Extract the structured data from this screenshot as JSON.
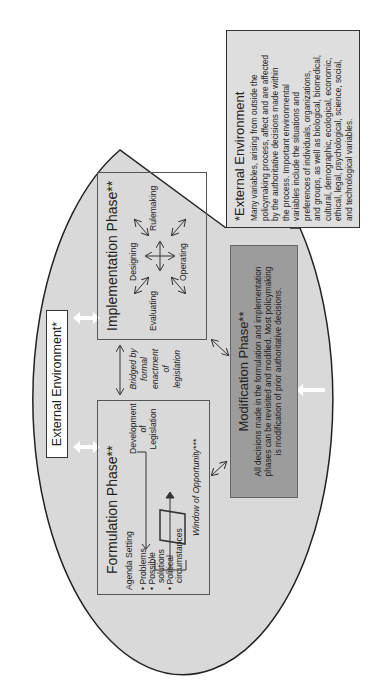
{
  "external_environment_label": "External Environment*",
  "formulation": {
    "title": "Formulation Phase**",
    "agenda_setting": "Agenda Setting",
    "bullets": [
      "Problems",
      "Possible",
      "solutions",
      "Political",
      "circumstances"
    ],
    "development": [
      "Development",
      "of",
      "Legislation"
    ],
    "window": "Window of Opportunity***"
  },
  "bridge": [
    "Bridged by",
    "formal",
    "enactment",
    "of",
    "legislation"
  ],
  "implementation": {
    "title": "Implementation Phase**",
    "designing": "Designing",
    "rulemaking": "Rulemaking",
    "evaluating": "Evaluating",
    "operating": "Operating"
  },
  "modification": {
    "title": "Modification Phase**",
    "lines": [
      "All decisions made in the formulation and implementation",
      "phases can be revisited and modified. Most policymaking",
      "is modification of prior authoritative decisions."
    ]
  },
  "note": {
    "title": "*External Environment",
    "lines": [
      "Many variables, arising from outside the",
      "policymaking process, affect and are affected",
      "by the authoritative decisions made within",
      "the process. Important environmental",
      "variables include the situations and",
      "preferences of individuals, organizations,",
      "and groups, as well as biological, biomedical,",
      "cultural, demographic, ecological, economic,",
      "ethical, legal, psychological, science, social,",
      "and technological variables."
    ]
  },
  "colors": {
    "oval_fill": "#d9d9d9",
    "modification_fill": "#9c9c9c",
    "note_fill": "#dedede"
  }
}
